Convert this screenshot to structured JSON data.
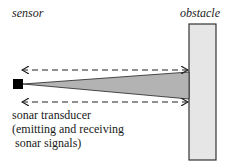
{
  "labels": {
    "sensor": "sensor",
    "obstacle": "obstacle",
    "transducer_lines": [
      "sonar transducer",
      "(emitting and receiving",
      " sonar signals)"
    ]
  },
  "colors": {
    "beam_fill": "#b3b3b3",
    "obstacle_fill": "#e6e6e6",
    "stroke": "#222222",
    "sensor_fill": "#000000"
  },
  "arrows": [
    {
      "name": "upper-signal-arrow",
      "direction": "bidirectional",
      "style": "dashed"
    },
    {
      "name": "lower-signal-arrow",
      "direction": "bidirectional",
      "style": "dashed"
    }
  ]
}
